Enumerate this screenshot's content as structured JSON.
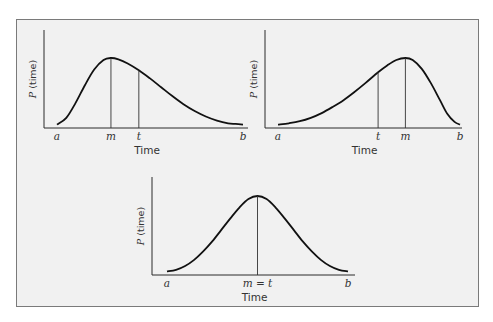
{
  "chart_data": [
    {
      "type": "line",
      "title": "Right-skewed distribution (mode before mean)",
      "xlabel": "Time",
      "ylabel_prefix": "P",
      "ylabel_suffix": " (time)",
      "x_range": [
        0,
        1
      ],
      "y_range": [
        0,
        1
      ],
      "ticks": [
        {
          "label": "a",
          "x": 0.0,
          "line": false
        },
        {
          "label": "m",
          "x": 0.29,
          "line": true
        },
        {
          "label": "t",
          "x": 0.44,
          "line": true
        },
        {
          "label": "b",
          "x": 1.0,
          "line": false
        }
      ],
      "series": [
        {
          "name": "P(time)",
          "x": [
            0,
            0.05,
            0.1,
            0.15,
            0.2,
            0.25,
            0.29,
            0.33,
            0.38,
            0.44,
            0.5,
            0.56,
            0.62,
            0.68,
            0.74,
            0.8,
            0.86,
            0.92,
            0.96,
            1.0
          ],
          "y": [
            0.02,
            0.12,
            0.34,
            0.6,
            0.83,
            0.97,
            1.0,
            0.98,
            0.92,
            0.82,
            0.7,
            0.57,
            0.44,
            0.32,
            0.22,
            0.14,
            0.08,
            0.04,
            0.03,
            0.02
          ]
        }
      ]
    },
    {
      "type": "line",
      "title": "Left-skewed distribution (mean before mode)",
      "xlabel": "Time",
      "ylabel_prefix": "P",
      "ylabel_suffix": " (time)",
      "x_range": [
        0,
        1
      ],
      "y_range": [
        0,
        1
      ],
      "ticks": [
        {
          "label": "a",
          "x": 0.0,
          "line": false
        },
        {
          "label": "t",
          "x": 0.55,
          "line": true
        },
        {
          "label": "m",
          "x": 0.7,
          "line": true
        },
        {
          "label": "b",
          "x": 1.0,
          "line": false
        }
      ],
      "series": [
        {
          "name": "P(time)",
          "x": [
            0,
            0.06,
            0.12,
            0.18,
            0.24,
            0.3,
            0.36,
            0.42,
            0.48,
            0.55,
            0.6,
            0.65,
            0.7,
            0.74,
            0.79,
            0.84,
            0.89,
            0.93,
            0.97,
            1.0
          ],
          "y": [
            0.02,
            0.04,
            0.07,
            0.12,
            0.19,
            0.28,
            0.38,
            0.5,
            0.63,
            0.79,
            0.89,
            0.97,
            1.0,
            0.97,
            0.84,
            0.63,
            0.38,
            0.18,
            0.06,
            0.02
          ]
        }
      ]
    },
    {
      "type": "line",
      "title": "Symmetric distribution (mode equals mean)",
      "xlabel": "Time",
      "ylabel_prefix": "P",
      "ylabel_suffix": " (time)",
      "x_range": [
        0,
        1
      ],
      "y_range": [
        0,
        1
      ],
      "ticks": [
        {
          "label": "a",
          "x": 0.0,
          "line": false
        },
        {
          "label": "m = t",
          "x": 0.5,
          "line": true
        },
        {
          "label": "b",
          "x": 1.0,
          "line": false
        }
      ],
      "series": [
        {
          "name": "P(time)",
          "x": [
            0,
            0.05,
            0.1,
            0.15,
            0.2,
            0.25,
            0.3,
            0.35,
            0.4,
            0.45,
            0.5,
            0.55,
            0.6,
            0.65,
            0.7,
            0.75,
            0.8,
            0.85,
            0.9,
            0.95,
            1.0
          ],
          "y": [
            0.02,
            0.04,
            0.09,
            0.17,
            0.28,
            0.41,
            0.56,
            0.71,
            0.85,
            0.96,
            1.0,
            0.96,
            0.85,
            0.71,
            0.56,
            0.41,
            0.28,
            0.17,
            0.09,
            0.04,
            0.02
          ]
        }
      ]
    }
  ]
}
